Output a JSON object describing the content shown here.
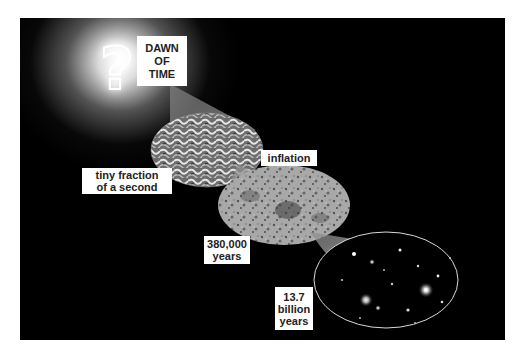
{
  "diagram": {
    "labels": {
      "dawn": [
        "DAWN",
        "OF",
        "TIME"
      ],
      "tiny_fraction": [
        "tiny fraction",
        "of a second"
      ],
      "inflation": [
        "inflation"
      ],
      "cmb": [
        "380,000",
        "years"
      ],
      "present": [
        "13.7",
        "billion",
        "years"
      ]
    },
    "stages": [
      {
        "name": "dawn-of-time",
        "icon": "question-mark-icon",
        "symbol": "?"
      },
      {
        "name": "inflation-texture",
        "description": "quantum fluctuation texture"
      },
      {
        "name": "cosmic-microwave-background",
        "description": "mottled CMB map"
      },
      {
        "name": "galaxies",
        "description": "field of galaxies"
      }
    ],
    "colors": {
      "background": "#000000",
      "glow": "#ffffff",
      "label_bg": "#ffffff",
      "label_text": "#222222",
      "cone": "#9a9a9a"
    }
  }
}
